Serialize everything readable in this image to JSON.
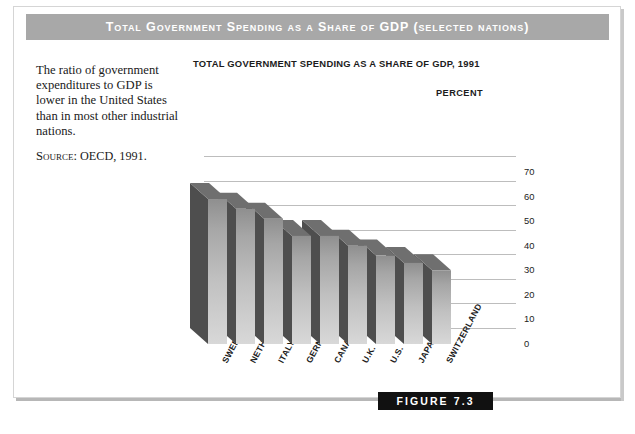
{
  "banner": {
    "title": "Total Government Spending as a Share of GDP (selected nations)"
  },
  "caption": {
    "body": "The ratio of government expenditures to GDP is lower in the United States than in most other industrial nations.",
    "source_label": "Source:",
    "source_value": " OECD, 1991."
  },
  "figure": {
    "badge": "FIGURE 7.3"
  },
  "chart_data": {
    "type": "bar",
    "title": "TOTAL GOVERNMENT SPENDING AS A SHARE OF GDP, 1991",
    "xlabel": "",
    "ylabel": "PERCENT",
    "categories": [
      "SWEDEN",
      "NETHERLANDS",
      "ITALY",
      "GERMANY",
      "CANADA",
      "U.K.",
      "U.S.",
      "JAPAN",
      "SWITZERLAND"
    ],
    "values": [
      59,
      55,
      51,
      44,
      44,
      40,
      36,
      33,
      30
    ],
    "ylim": [
      0,
      70
    ],
    "yticks": [
      70,
      60,
      50,
      40,
      30,
      20,
      10,
      0
    ],
    "grid": true,
    "legend": "none",
    "style": "3d-columns",
    "colors": {
      "bar_front_top": "#9c9c9c",
      "bar_front_bottom": "#d4d4d4",
      "bar_side": "#4e4e4e",
      "gridline": "#bdbdbd",
      "banner": "#a8a8a8",
      "badge": "#111111"
    }
  }
}
